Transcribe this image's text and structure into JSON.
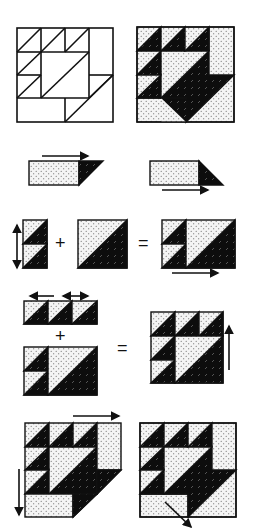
{
  "colors": {
    "outline": "#111111",
    "dark_fabric": "#0d0d0d",
    "light_fabric": "#f2f2f2",
    "background": "#ffffff"
  },
  "fabrics": {
    "light": "light-dotted-print",
    "dark": "dark-dashed-print"
  },
  "steps": [
    {
      "id": "step-1",
      "description": "Block layout: line drawing and shaded version (4x4 grid basket block)"
    },
    {
      "id": "step-2",
      "description": "Sew dark triangle to end of light rectangle (two mirrored units)"
    },
    {
      "id": "step-3",
      "description": "Two half-square-triangle units stacked + large half-square triangle",
      "operators": [
        "+",
        "="
      ]
    },
    {
      "id": "step-4",
      "description": "Row of three half-square-triangle units + lower section",
      "operators": [
        "+",
        "="
      ]
    },
    {
      "id": "step-5",
      "description": "Add side rectangle units to complete the basket block"
    }
  ],
  "operators": {
    "plus": "+",
    "equals": "="
  },
  "icons": [
    "arrow-right-icon",
    "arrow-double-vertical-icon",
    "arrow-double-horizontal-icon",
    "arrow-left-icon",
    "arrow-up-icon",
    "arrow-down-icon",
    "arrow-diagonal-icon"
  ]
}
